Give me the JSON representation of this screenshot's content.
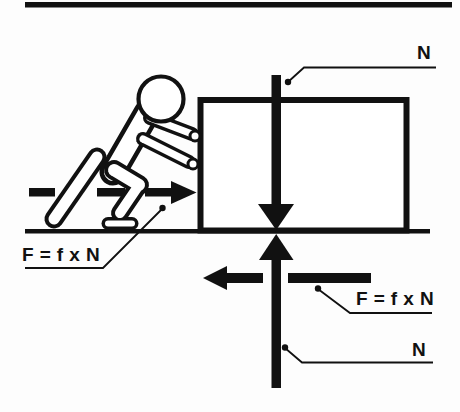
{
  "diagram": {
    "labels": {
      "top_normal": "N",
      "applied_force_formula": "F = f x N",
      "friction_force_formula": "F = f x N",
      "bottom_normal": "N"
    },
    "icons": {
      "normal_force_down": "down-arrow-icon",
      "normal_force_up": "up-arrow-icon",
      "applied_force": "right-arrow-icon",
      "friction_force": "left-arrow-icon",
      "figure": "person-pushing-icon"
    },
    "colors": {
      "ink": "#111111",
      "background": "#fdfdfd",
      "fill_white": "#ffffff"
    }
  }
}
